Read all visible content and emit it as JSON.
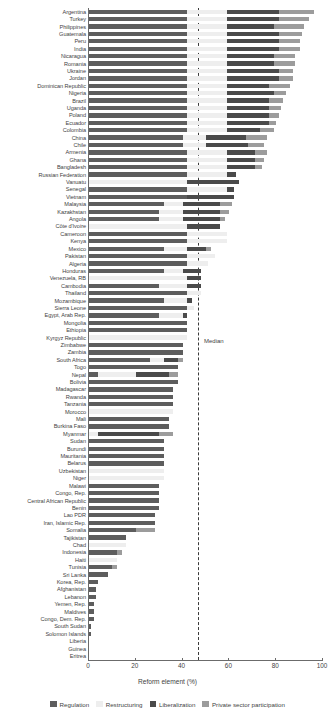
{
  "chart_data": {
    "type": "bar",
    "orientation": "horizontal",
    "stacked": true,
    "title": "",
    "xlabel": "Reform element (%)",
    "ylabel": "",
    "xlim": [
      0,
      100
    ],
    "xticks": [
      0,
      20,
      40,
      60,
      80,
      100
    ],
    "grid": false,
    "legend_position": "bottom",
    "annotations": [
      {
        "label": "Median",
        "value": 47,
        "style": "dashed-vertical-line"
      }
    ],
    "series": [
      {
        "name": "Regulation",
        "color": "#5d5d5d"
      },
      {
        "name": "Restructuring",
        "color": "#eeeeee"
      },
      {
        "name": "Liberalization",
        "color": "#4a4a4a"
      },
      {
        "name": "Private sector participation",
        "color": "#9c9c9c"
      }
    ],
    "categories": [
      "Argentina",
      "Turkey",
      "Philippines",
      "Guatemala",
      "Peru",
      "India",
      "Nicaragua",
      "Romania",
      "Ukraine",
      "Jordan",
      "Dominican Republic",
      "Nigeria",
      "Brazil",
      "Uganda",
      "Poland",
      "Ecuador",
      "Colombia",
      "China",
      "Chile",
      "Armenia",
      "Ghana",
      "Bangladesh",
      "Russian Federation",
      "Vanuatu",
      "Senegal",
      "Vietnam",
      "Malaysia",
      "Kazakhstan",
      "Angola",
      "Côte d'Ivoire",
      "Cameroon",
      "Kenya",
      "Mexico",
      "Pakistan",
      "Algeria",
      "Honduras",
      "Venezuela, RB",
      "Cambodia",
      "Thailand",
      "Mozambique",
      "Sierra Leone",
      "Egypt, Arab Rep.",
      "Mongolia",
      "Ethiopia",
      "Kyrgyz Republic",
      "Zimbabwe",
      "Zambia",
      "South Africa",
      "Togo",
      "Nepal",
      "Bolivia",
      "Madagascar",
      "Rwanda",
      "Tanzania",
      "Morocco",
      "Mali",
      "Burkina Faso",
      "Myanmar",
      "Sudan",
      "Burundi",
      "Mauritania",
      "Belarus",
      "Uzbekistan",
      "Niger",
      "Malawi",
      "Congo, Rep.",
      "Central African Republic",
      "Benin",
      "Lao PDR",
      "Iran, Islamic Rep.",
      "Somalia",
      "Tajikistan",
      "Chad",
      "Indonesia",
      "Haiti",
      "Tunisia",
      "Sri Lanka",
      "Korea, Rep.",
      "Afghanistan",
      "Lebanon",
      "Yemen, Rep.",
      "Maldives",
      "Congo, Dem. Rep.",
      "South Sudan",
      "Solomon Islands",
      "Liberia",
      "Guinea",
      "Eritrea"
    ],
    "values": [
      [
        42,
        17,
        22,
        15
      ],
      [
        42,
        17,
        22,
        13
      ],
      [
        42,
        17,
        20,
        13
      ],
      [
        42,
        17,
        22,
        10
      ],
      [
        42,
        17,
        22,
        9
      ],
      [
        42,
        17,
        22,
        9
      ],
      [
        42,
        17,
        20,
        9
      ],
      [
        42,
        17,
        20,
        9
      ],
      [
        42,
        17,
        22,
        6
      ],
      [
        42,
        17,
        22,
        6
      ],
      [
        42,
        17,
        18,
        9
      ],
      [
        42,
        17,
        20,
        5
      ],
      [
        42,
        17,
        18,
        6
      ],
      [
        42,
        17,
        18,
        5
      ],
      [
        42,
        17,
        18,
        4
      ],
      [
        42,
        17,
        18,
        3
      ],
      [
        42,
        17,
        14,
        6
      ],
      [
        40,
        10,
        17,
        9
      ],
      [
        40,
        10,
        18,
        7
      ],
      [
        42,
        17,
        12,
        5
      ],
      [
        42,
        17,
        12,
        4
      ],
      [
        42,
        17,
        12,
        3
      ],
      [
        42,
        17,
        4,
        0
      ],
      [
        0,
        42,
        22,
        0
      ],
      [
        42,
        17,
        3,
        0
      ],
      [
        42,
        0,
        20,
        0
      ],
      [
        32,
        8,
        16,
        5
      ],
      [
        30,
        10,
        16,
        4
      ],
      [
        30,
        10,
        16,
        2
      ],
      [
        0,
        42,
        14,
        0
      ],
      [
        42,
        17,
        0,
        0
      ],
      [
        42,
        17,
        0,
        0
      ],
      [
        32,
        10,
        8,
        2
      ],
      [
        42,
        12,
        0,
        0
      ],
      [
        42,
        9,
        0,
        0
      ],
      [
        32,
        8,
        8,
        0
      ],
      [
        0,
        42,
        6,
        0
      ],
      [
        30,
        12,
        6,
        0
      ],
      [
        42,
        6,
        0,
        0
      ],
      [
        32,
        10,
        2,
        0
      ],
      [
        42,
        3,
        0,
        0
      ],
      [
        30,
        10,
        2,
        0
      ],
      [
        42,
        0,
        0,
        0
      ],
      [
        42,
        0,
        0,
        0
      ],
      [
        0,
        42,
        0,
        0
      ],
      [
        40,
        0,
        0,
        0
      ],
      [
        40,
        0,
        0,
        0
      ],
      [
        26,
        6,
        6,
        2
      ],
      [
        38,
        0,
        0,
        0
      ],
      [
        4,
        16,
        14,
        4
      ],
      [
        38,
        0,
        0,
        0
      ],
      [
        36,
        0,
        0,
        0
      ],
      [
        36,
        0,
        0,
        0
      ],
      [
        36,
        0,
        0,
        0
      ],
      [
        0,
        36,
        0,
        0
      ],
      [
        34,
        0,
        0,
        0
      ],
      [
        34,
        0,
        0,
        0
      ],
      [
        0,
        4,
        26,
        6
      ],
      [
        32,
        0,
        0,
        0
      ],
      [
        32,
        0,
        0,
        0
      ],
      [
        32,
        0,
        0,
        0
      ],
      [
        32,
        0,
        0,
        0
      ],
      [
        0,
        32,
        0,
        0
      ],
      [
        0,
        32,
        0,
        0
      ],
      [
        30,
        0,
        0,
        0
      ],
      [
        30,
        0,
        0,
        0
      ],
      [
        30,
        0,
        0,
        0
      ],
      [
        30,
        0,
        0,
        0
      ],
      [
        28,
        0,
        0,
        0
      ],
      [
        28,
        0,
        0,
        0
      ],
      [
        20,
        0,
        0,
        8
      ],
      [
        16,
        0,
        0,
        0
      ],
      [
        0,
        16,
        0,
        0
      ],
      [
        12,
        0,
        0,
        2
      ],
      [
        0,
        12,
        0,
        0
      ],
      [
        10,
        0,
        0,
        2
      ],
      [
        8,
        0,
        0,
        0
      ],
      [
        4,
        0,
        0,
        0
      ],
      [
        3,
        0,
        0,
        0
      ],
      [
        3,
        0,
        0,
        0
      ],
      [
        2,
        0,
        0,
        0
      ],
      [
        2,
        0,
        0,
        0
      ],
      [
        2,
        0,
        0,
        0
      ],
      [
        1,
        0,
        0,
        0
      ],
      [
        1,
        0,
        0,
        0
      ],
      [
        0,
        0,
        0,
        0
      ],
      [
        0,
        0,
        0,
        0
      ],
      [
        0,
        0,
        0,
        0
      ]
    ]
  },
  "legend": {
    "items": [
      {
        "label": "Regulation",
        "color": "#5d5d5d"
      },
      {
        "label": "Restructuring",
        "color": "#eeeeee"
      },
      {
        "label": "Liberalization",
        "color": "#4a4a4a"
      },
      {
        "label": "Private sector participation",
        "color": "#9c9c9c"
      }
    ]
  },
  "axis": {
    "x_title": "Reform element (%)",
    "tick_labels": [
      "0",
      "20",
      "40",
      "60",
      "80",
      "100"
    ]
  },
  "median": {
    "label": "Median",
    "value": 47
  }
}
